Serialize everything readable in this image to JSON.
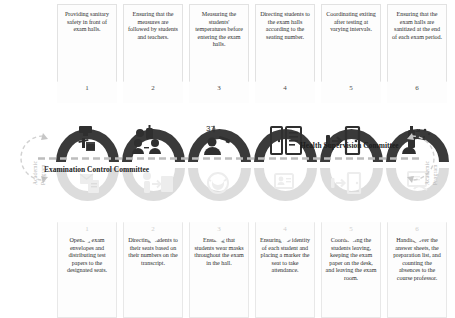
{
  "diagram": {
    "colors": {
      "dark_arch": "#3a3a3a",
      "light_arch": "#dcdcdc",
      "card_border": "#e2e2e2",
      "dashed_line": "#bdbdbd",
      "side_arrow": "#cccccc",
      "number_top": "#4a4a4a",
      "number_bottom": "#cfcfcf"
    },
    "top_committee": {
      "label": "Health Supervision Committee",
      "steps": [
        {
          "number": "1",
          "text": "Providing sanitary safety in front of exam halls.",
          "icon": "sanitizer-dispenser-icon"
        },
        {
          "number": "2",
          "text": "Ensuring that the measures are followed by students and teachers.",
          "icon": "supervision-people-icon"
        },
        {
          "number": "3",
          "text": "Measuring the students' temperatures before entering the exam halls.",
          "icon": "thermometer-scan-icon"
        },
        {
          "number": "4",
          "text": "Directing students to the exam halls according to the seating number.",
          "icon": "door-checklist-icon"
        },
        {
          "number": "5",
          "text": "Coordinating exiting after testing at varying intervals.",
          "icon": "door-exit-arrow-icon"
        },
        {
          "number": "6",
          "text": "Ensuring that the exam halls are sanitized at the end of each exam period.",
          "icon": "spray-cleaning-icon"
        }
      ]
    },
    "bottom_committee": {
      "label": "Examination Control Committee",
      "steps": [
        {
          "number": "1",
          "text": "Opening exam envelopes and distributing test papers to the designated seats.",
          "icon": "envelope-papers-icon"
        },
        {
          "number": "2",
          "text": "Directing students to their seats based on their numbers on the transcript.",
          "icon": "direct-seat-icon"
        },
        {
          "number": "3",
          "text": "Ensuring that students wear masks throughout the exam in the hall.",
          "icon": "face-mask-icon"
        },
        {
          "number": "4",
          "text": "Ensuring the identity of each student and placing a marker the seat to take attendance.",
          "icon": "id-card-icon"
        },
        {
          "number": "5",
          "text": "Coordinating the students leaving, keeping the exam paper on the desk, and leaving the exam room.",
          "icon": "exit-door-icon"
        },
        {
          "number": "6",
          "text": "Handing over the answer sheets, the preparation list, and counting the absences to the course professor.",
          "icon": "handover-papers-icon"
        }
      ]
    },
    "side_cycle": {
      "left_line_1": "Academic",
      "left_line_2": "Program",
      "right_line_1": "Academic",
      "right_line_2": "Program",
      "icon": "circular-arrow-icon"
    }
  }
}
